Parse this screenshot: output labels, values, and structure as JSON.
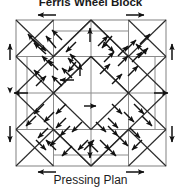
{
  "title": {
    "text": "Ferris Wheel Block"
  },
  "caption": {
    "text": "Pressing Plan"
  },
  "diagram": {
    "name": "quilt-block-pressing-plan",
    "grid": {
      "columns": 4,
      "rows": 4
    },
    "block_bounds": {
      "x": 16,
      "y": 20,
      "width": 150,
      "height": 146
    },
    "colors": {
      "seam_line": "#8c8c8c",
      "diagonal_line": "#2b2b2b",
      "arrow": "#111111",
      "background": "#ffffff",
      "text": "#1a1a1a"
    },
    "legend": {
      "arrow_meaning": "direction to press seam allowance"
    },
    "arrow_count": 56
  }
}
